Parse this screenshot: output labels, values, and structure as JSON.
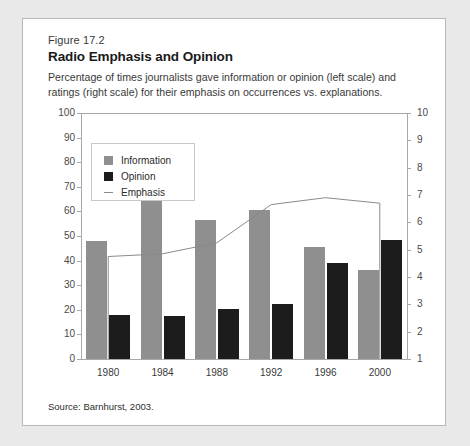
{
  "figure": {
    "number": "Figure 17.2",
    "title": "Radio Emphasis and Opinion",
    "subtitle": "Percentage of times journalists gave information or opinion (left scale) and ratings (right scale) for their emphasis on occurrences vs. explanations.",
    "source": "Source: Barnhurst, 2003."
  },
  "legend": {
    "items": [
      {
        "label": "Information",
        "marker": "filled-square",
        "color": "#8f8f8f"
      },
      {
        "label": "Opinion",
        "marker": "filled-square",
        "color": "#1c1c1c"
      },
      {
        "label": "Emphasis",
        "marker": "line",
        "color": "#8a8a8a"
      }
    ]
  },
  "chart_data": {
    "type": "bar",
    "title": "Radio Emphasis and Opinion",
    "subtitle": "Percentage of times journalists gave information or opinion (left scale) and ratings (right scale) for their emphasis on occurrences vs. explanations.",
    "xlabel": "",
    "ylabel": "",
    "categories": [
      "1980",
      "1984",
      "1988",
      "1992",
      "1996",
      "2000"
    ],
    "grid": false,
    "legend_position": "top-left-inside",
    "left_axis": {
      "label": "",
      "ylim": [
        0,
        100
      ],
      "ticks": [
        0,
        10,
        20,
        30,
        40,
        50,
        60,
        70,
        80,
        90,
        100
      ],
      "tick_labels": [
        "0",
        "10",
        "20",
        "30",
        "40",
        "50",
        "60",
        "70",
        "80",
        "90",
        "100"
      ]
    },
    "right_axis": {
      "label": "",
      "ylim": [
        1,
        10
      ],
      "ticks": [
        1,
        2,
        3,
        4,
        5,
        6,
        7,
        8,
        9,
        10
      ],
      "tick_labels": [
        "1",
        "2",
        "3",
        "4",
        "5",
        "6",
        "7",
        "8",
        "9",
        "10"
      ]
    },
    "series": [
      {
        "name": "Information",
        "type": "bar",
        "axis": "left",
        "color": "#8f8f8f",
        "values": [
          48,
          65,
          56.5,
          60.5,
          45.5,
          36
        ]
      },
      {
        "name": "Opinion",
        "type": "bar",
        "axis": "left",
        "color": "#1c1c1c",
        "values": [
          18,
          17.5,
          20.5,
          22.5,
          39,
          48.5
        ]
      },
      {
        "name": "Emphasis",
        "type": "line",
        "axis": "right",
        "color": "#8a8a8a",
        "values": [
          4.75,
          4.85,
          5.25,
          6.65,
          6.9,
          6.7
        ]
      }
    ]
  }
}
